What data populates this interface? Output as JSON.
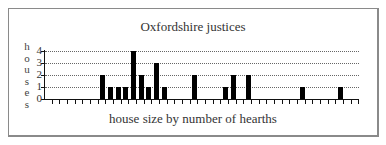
{
  "chart_data": {
    "type": "bar",
    "title": "Oxfordshire justices",
    "xlabel": "house size by number of hearths",
    "ylabel": "houses",
    "ylabel_letters": [
      "h",
      "o",
      "u",
      "s",
      "e",
      "s"
    ],
    "yticks": [
      "4",
      "3",
      "2",
      "1",
      "0"
    ],
    "ylim": [
      0,
      4
    ],
    "grid": true,
    "grid_style": "dotted",
    "legend": "none",
    "x": [
      1,
      2,
      3,
      4,
      5,
      6,
      7,
      8,
      9,
      10,
      11,
      12,
      13,
      14,
      15,
      16,
      17,
      18,
      19,
      20,
      21,
      22,
      23,
      24,
      25,
      26,
      27,
      28,
      29,
      30,
      31,
      32,
      33,
      34,
      35,
      36,
      37,
      38,
      39,
      40,
      41
    ],
    "values": [
      0,
      0,
      0,
      0,
      0,
      0,
      0,
      2,
      1,
      1,
      1,
      4,
      2,
      1,
      3,
      1,
      0,
      0,
      0,
      2,
      0,
      0,
      0,
      1,
      2,
      0,
      2,
      0,
      0,
      0,
      0,
      0,
      0,
      1,
      0,
      0,
      0,
      0,
      1,
      0,
      0
    ],
    "bar_color": "#000000"
  }
}
